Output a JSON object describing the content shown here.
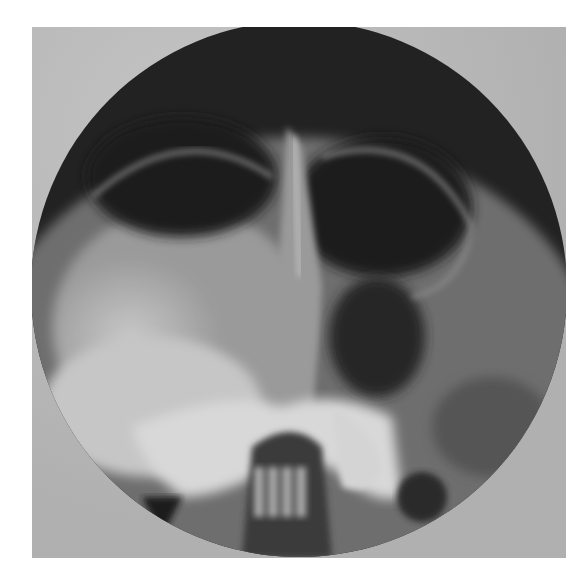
{
  "image": {
    "subject": "sinus-radiograph",
    "view": "occipitomental",
    "collimation": "circular",
    "colors": {
      "background": "#ffffff",
      "plate": "#b8b8b8",
      "air_dark": "#1c1c1c",
      "bone_light": "#d8d8d8",
      "soft_tissue": "#8a8a8a"
    }
  }
}
